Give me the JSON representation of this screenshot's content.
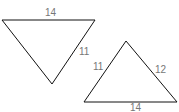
{
  "diagram": {
    "triangles": [
      {
        "name": "inverted-triangle",
        "points": "2,20 95,20 52,84",
        "labels": [
          {
            "text": "14",
            "x": 50,
            "y": 16
          },
          {
            "text": "11",
            "x": 85,
            "y": 55
          }
        ]
      },
      {
        "name": "upright-triangle",
        "points": "126,41 84,102 177,102",
        "labels": [
          {
            "text": "11",
            "x": 98,
            "y": 70
          },
          {
            "text": "12",
            "x": 160,
            "y": 73
          },
          {
            "text": "14",
            "x": 135,
            "y": 111
          }
        ]
      }
    ],
    "colors": {
      "stroke": "#111111",
      "label": "#777777"
    }
  }
}
